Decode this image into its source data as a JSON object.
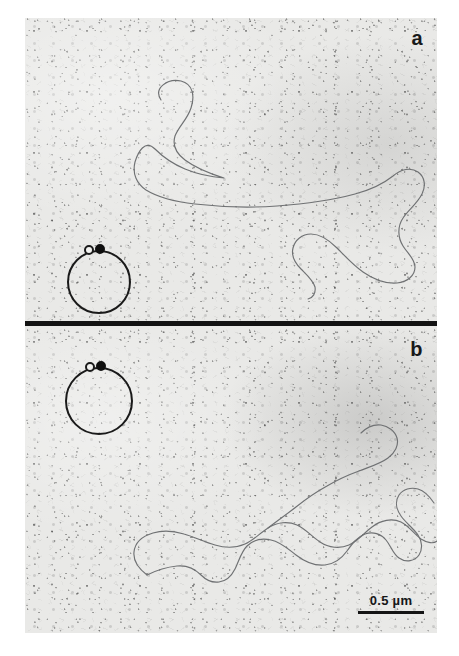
{
  "figure": {
    "type": "electron-micrograph",
    "background_color": "#ffffff",
    "plate_color": "#e9e9e7"
  },
  "panels": [
    {
      "id": "a",
      "label": "a",
      "inset": {
        "name": "circular-plasmid-schematic",
        "shape": "circle",
        "markers": [
          {
            "name": "open-marker",
            "style": "open",
            "color": "#f2f2f0"
          },
          {
            "name": "filled-marker",
            "style": "filled",
            "color": "#0f0f0f"
          }
        ]
      },
      "specimen": {
        "name": "dna-molecule-trace",
        "description": "relaxed open circular DNA filament with large upper loop and smaller lower-right loop"
      }
    },
    {
      "id": "b",
      "label": "b",
      "inset": {
        "name": "circular-plasmid-schematic",
        "shape": "circle",
        "markers": [
          {
            "name": "open-marker",
            "style": "open",
            "color": "#f2f2f0"
          },
          {
            "name": "filled-marker",
            "style": "filled",
            "color": "#0f0f0f"
          }
        ]
      },
      "specimen": {
        "name": "dna-molecule-trace",
        "description": "elongated collapsed circular DNA filament running diagonally lower-left to upper-right"
      }
    }
  ],
  "divider": {
    "name": "panel-divider-bar",
    "color": "#131313"
  },
  "scalebar": {
    "label": "0.5 µm",
    "value": 0.5,
    "unit": "µm",
    "color": "#141414"
  },
  "traces": {
    "panel_a": "M 136 82 C 128 70, 143 60, 156 63 C 168 66, 170 78, 166 90 C 162 102, 154 108, 150 118 C 147 128, 152 136, 160 142 C 172 151, 186 156, 199 160 C 186 159, 172 156, 160 151 C 148 146, 138 139, 130 131 C 120 121, 113 134, 110 144 C 107 156, 112 166, 121 172 C 134 180, 152 184, 170 186 C 196 189, 224 190, 252 188 C 280 186, 308 182, 330 176 C 345 172, 358 166, 368 158 C 376 151, 386 149, 393 154 C 400 159, 401 168, 397 176 C 392 186, 383 192, 378 200 C 372 209, 373 220, 378 228 C 383 236, 390 241, 390 249 C 390 258, 382 264, 372 265 C 360 266, 348 261, 338 254 C 328 247, 320 238, 312 230 C 304 222, 295 216, 286 216 C 277 216, 270 222, 268 230 C 266 238, 270 245, 276 251 C 282 257, 288 262, 290 269 C 291 275, 288 280, 283 281",
    "panel_b": "M 122 557 C 132 552, 142 549, 152 548 C 162 547, 170 551, 176 557 C 181 562, 187 565, 194 564 C 202 563, 207 557, 210 551 C 214 543, 216 534, 222 528 C 228 522, 237 520, 246 522 C 256 524, 263 531, 271 537 C 280 544, 290 548, 300 547 C 310 546, 317 540, 322 533 C 327 526, 332 519, 340 516 C 348 513, 356 516, 361 522 C 366 528, 368 536, 374 540 C 381 545, 390 543, 394 537 C 398 531, 397 523, 393 517 C 388 510, 381 505, 376 498 C 371 491, 370 483, 374 477 C 378 471, 386 469, 393 471 C 400 473, 405 479, 409 485",
    "panel_b2": "M 122 557 C 114 551, 108 543, 109 534 C 110 524, 118 518, 128 515 C 138 512, 149 513, 159 516 C 170 519, 179 524, 190 527 C 200 530, 211 530, 220 526 C 229 522, 235 515, 243 510 C 252 504, 263 503, 272 507 C 281 511, 287 519, 295 524 C 304 530, 315 531, 324 527 C 333 523, 339 515, 347 509 C 356 502, 367 500, 376 504 C 384 508, 389 516, 396 521 C 402 525, 409 526, 412 523",
    "panel_b3": "M 243 510 C 252 503, 262 496, 271 489 C 281 481, 291 474, 302 468 C 312 462, 323 457, 334 453 C 344 449, 355 446, 363 440 C 370 435, 374 427, 372 420 C 370 413, 363 408, 356 407 C 348 406, 341 410, 336 415"
  }
}
